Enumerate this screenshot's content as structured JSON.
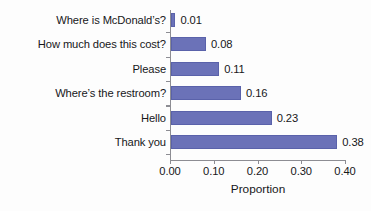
{
  "chart_data": {
    "type": "bar",
    "orientation": "horizontal",
    "title": "",
    "xlabel": "Proportion",
    "ylabel": "",
    "categories": [
      "Where is McDonald’s?",
      "How much does this cost?",
      "Please",
      "Where’s the restroom?",
      "Hello",
      "Thank you"
    ],
    "values": [
      0.01,
      0.08,
      0.11,
      0.16,
      0.23,
      0.38
    ],
    "value_labels": [
      "0.01",
      "0.08",
      "0.11",
      "0.16",
      "0.23",
      "0.38"
    ],
    "xlim": [
      0.0,
      0.4
    ],
    "xticks": [
      0.0,
      0.1,
      0.2,
      0.3,
      0.4
    ],
    "xtick_labels": [
      "0.00",
      "0.10",
      "0.20",
      "0.30",
      "0.40"
    ],
    "grid": false,
    "legend": null,
    "bar_color": "#6b72b8",
    "axis_color": "#8d8d93",
    "text_color": "#17171a",
    "background_color": "#fdfdfd"
  }
}
